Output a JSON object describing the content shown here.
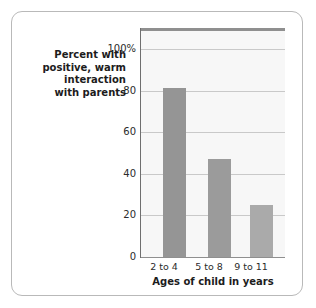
{
  "chart_data": {
    "type": "bar",
    "title": "",
    "subtitle": "",
    "xlabel": "Ages of child in years",
    "ylabel": "Percent with positive, warm interaction with parents",
    "categories": [
      "2 to 4",
      "5 to 8",
      "9 to 11"
    ],
    "values": [
      81,
      47,
      25
    ],
    "ylim": [
      0,
      110
    ],
    "yticks": [
      0,
      20,
      40,
      60,
      80,
      100
    ],
    "ytick_labels": [
      "0",
      "20",
      "40",
      "60",
      "80",
      "100%"
    ],
    "grid": "horizontal",
    "legend": "none",
    "series": [
      {
        "name": "Percent with positive, warm interaction with parents",
        "values": [
          81,
          47,
          25
        ]
      }
    ],
    "bar_colors": [
      "#959595",
      "#9b9b9b",
      "#aaaaaa"
    ],
    "plot_background": "#f7f7f7",
    "gridline_color": "#c9c9c9",
    "axis_color": "#8f8f8f"
  },
  "axis": {
    "y_title_lines": [
      "Percent with",
      "positive, warm",
      "interaction",
      "with parents"
    ],
    "x_title": "Ages of child in years"
  },
  "ticks": {
    "t100": "100%",
    "t80": "80",
    "t60": "60",
    "t40": "40",
    "t20": "20",
    "t0": "0"
  },
  "categories": {
    "c0": "2 to 4",
    "c1": "5 to 8",
    "c2": "9 to 11"
  }
}
